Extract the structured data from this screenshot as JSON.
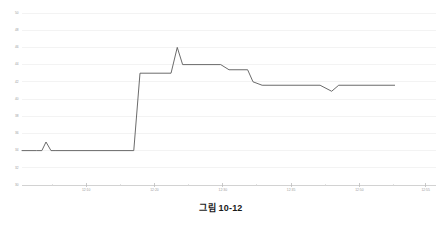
{
  "caption": "그림 10-12",
  "chart_data": {
    "type": "line",
    "title": "",
    "xlabel": "",
    "ylabel": "",
    "ylim": [
      30,
      50
    ],
    "ytick_step": 2,
    "ytick_labels": [
      "30",
      "32",
      "34",
      "36",
      "38",
      "40",
      "42",
      "44",
      "46",
      "48",
      "50"
    ],
    "ytick_values": [
      30,
      32,
      34,
      36,
      38,
      40,
      42,
      44,
      46,
      48,
      50
    ],
    "xtick_labels": [
      "12:10",
      "12:20",
      "12:30",
      "12:35",
      "12:50",
      "12:55"
    ],
    "xtick_positions": [
      0.155,
      0.32,
      0.485,
      0.65,
      0.815,
      0.975
    ],
    "grid": true,
    "legend": null,
    "line_color": "#5a5a5a",
    "grid_color": "#eeeeee",
    "axis_color": "#c9c9c9",
    "tick_label_color": "#9a9a9a",
    "x": [
      0.0,
      0.035,
      0.048,
      0.058,
      0.07,
      0.082,
      0.27,
      0.285,
      0.293,
      0.3,
      0.36,
      0.375,
      0.388,
      0.4,
      0.455,
      0.468,
      0.48,
      0.5,
      0.545,
      0.558,
      0.57,
      0.58,
      0.72,
      0.735,
      0.748,
      0.765,
      0.9
    ],
    "y": [
      34.0,
      34.0,
      34.0,
      35.0,
      34.0,
      34.0,
      34.0,
      43.0,
      43.0,
      43.0,
      43.0,
      46.0,
      44.0,
      44.0,
      44.0,
      44.0,
      44.0,
      43.4,
      43.4,
      42.0,
      42.0,
      41.6,
      41.6,
      41.6,
      40.9,
      41.6,
      41.6
    ],
    "series": [
      {
        "name": "series-1",
        "points": [
          {
            "x": 0.0,
            "y": 34.0
          },
          {
            "x": 0.035,
            "y": 34.0
          },
          {
            "x": 0.048,
            "y": 34.0
          },
          {
            "x": 0.058,
            "y": 35.0
          },
          {
            "x": 0.07,
            "y": 34.0
          },
          {
            "x": 0.082,
            "y": 34.0
          },
          {
            "x": 0.27,
            "y": 34.0
          },
          {
            "x": 0.285,
            "y": 43.0
          },
          {
            "x": 0.36,
            "y": 43.0
          },
          {
            "x": 0.375,
            "y": 46.0
          },
          {
            "x": 0.388,
            "y": 44.0
          },
          {
            "x": 0.48,
            "y": 44.0
          },
          {
            "x": 0.5,
            "y": 43.4
          },
          {
            "x": 0.545,
            "y": 43.4
          },
          {
            "x": 0.558,
            "y": 42.0
          },
          {
            "x": 0.58,
            "y": 41.6
          },
          {
            "x": 0.72,
            "y": 41.6
          },
          {
            "x": 0.748,
            "y": 40.9
          },
          {
            "x": 0.765,
            "y": 41.6
          },
          {
            "x": 0.9,
            "y": 41.6
          }
        ]
      }
    ]
  }
}
